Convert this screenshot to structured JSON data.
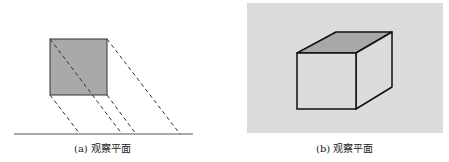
{
  "figure_a": {
    "caption": "(a) 观察平面",
    "square_fill": "#a9a9a9",
    "line_color": "#333333"
  },
  "figure_b": {
    "caption": "(b) 观察平面",
    "panel_fill": "#dcdcdc",
    "cube_top_fill": "#a8a8a8",
    "cube_face_fill": "#dcdcdc",
    "edge_color": "#111111"
  }
}
